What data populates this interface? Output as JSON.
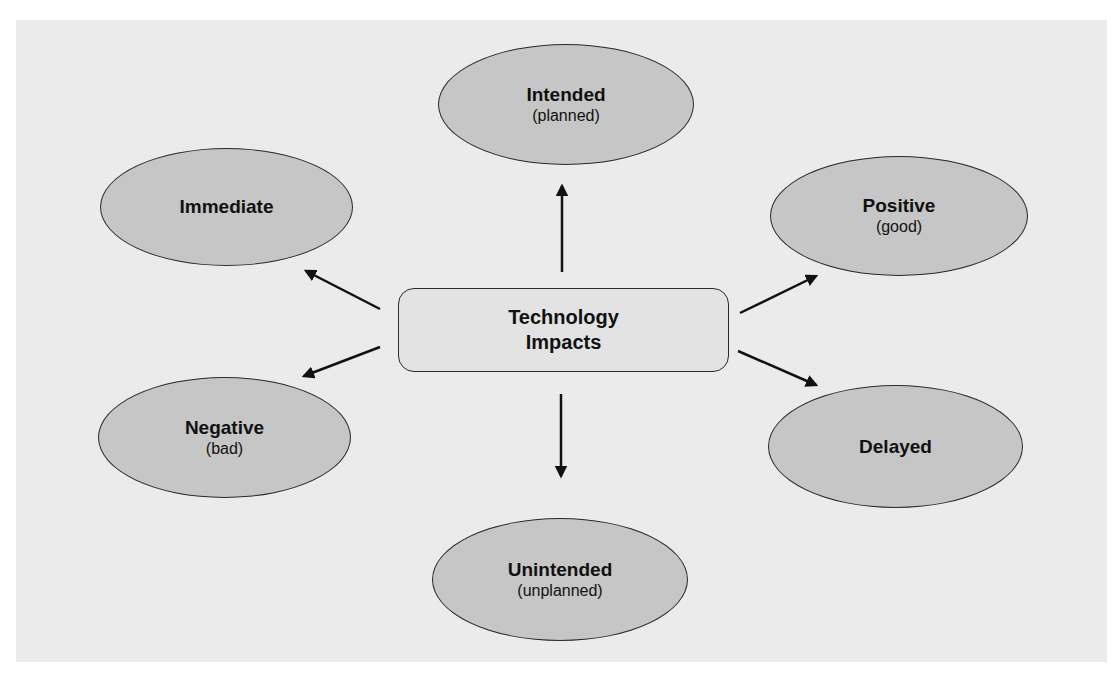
{
  "diagram": {
    "center": {
      "title": "Technology",
      "title2": "Impacts"
    },
    "nodes": [
      {
        "id": "intended",
        "title": "Intended",
        "subtitle": "(planned)"
      },
      {
        "id": "immediate",
        "title": "Immediate",
        "subtitle": ""
      },
      {
        "id": "positive",
        "title": "Positive",
        "subtitle": "(good)"
      },
      {
        "id": "negative",
        "title": "Negative",
        "subtitle": "(bad)"
      },
      {
        "id": "delayed",
        "title": "Delayed",
        "subtitle": ""
      },
      {
        "id": "unintended",
        "title": "Unintended",
        "subtitle": "(unplanned)"
      }
    ],
    "colors": {
      "background": "#ebebeb",
      "ellipse_fill": "#c6c6c6",
      "center_fill": "#e3e3e3",
      "stroke": "#2a2a2a"
    }
  }
}
